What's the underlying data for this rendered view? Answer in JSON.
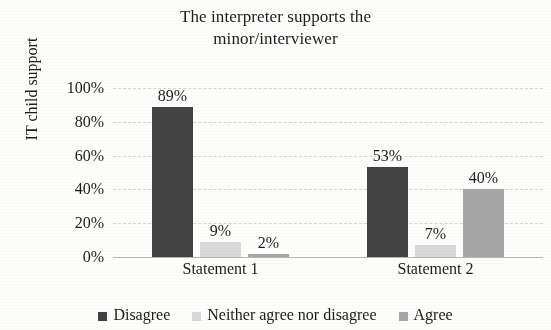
{
  "chart_data": {
    "type": "bar",
    "title": "The interpreter supports the minor/interviewer",
    "title_lines": [
      "The interpreter supports the",
      "minor/interviewer"
    ],
    "xlabel": "",
    "ylabel": "IT child support",
    "categories": [
      "Statement 1",
      "Statement 2"
    ],
    "series": [
      {
        "name": "Disagree",
        "color": "#424242",
        "values": [
          89,
          53
        ],
        "labels": [
          "89%",
          "53%"
        ]
      },
      {
        "name": "Neither agree nor disagree",
        "color": "#d9d9d9",
        "values": [
          9,
          7
        ],
        "labels": [
          "9%",
          "7%"
        ]
      },
      {
        "name": "Agree",
        "color": "#a6a6a6",
        "values": [
          2,
          40
        ],
        "labels": [
          "2%",
          "40%"
        ]
      }
    ],
    "ylim": [
      0,
      100
    ],
    "yticks": [
      0,
      20,
      40,
      60,
      80,
      100
    ],
    "ytick_labels": [
      "0%",
      "20%",
      "40%",
      "60%",
      "80%",
      "100%"
    ],
    "grid": true,
    "grid_style": "dashed-horizontal",
    "legend_position": "bottom",
    "value_labels": true,
    "units": "percent"
  },
  "legend": {
    "items": [
      {
        "label": "Disagree",
        "color": "#424242"
      },
      {
        "label": "Neither agree nor disagree",
        "color": "#d9d9d9"
      },
      {
        "label": "Agree",
        "color": "#a6a6a6"
      }
    ]
  }
}
